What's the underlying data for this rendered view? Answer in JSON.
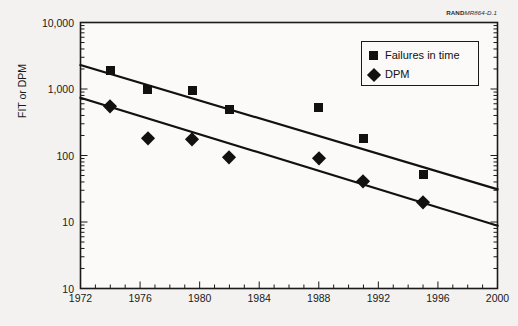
{
  "source_note": {
    "bold": "RAND",
    "italic": "MR864-D.1"
  },
  "chart_data": {
    "type": "scatter",
    "title": "",
    "xlabel": "",
    "ylabel": "FIT or DPM",
    "yscale": "log",
    "xlim": [
      1972,
      2000
    ],
    "ylim": [
      1,
      10000
    ],
    "grid": false,
    "legend_position": "top-right",
    "x_ticks": [
      "1972",
      "1976",
      "1980",
      "1984",
      "1988",
      "1992",
      "1996",
      "2000"
    ],
    "x_tick_values": [
      1972,
      1976,
      1980,
      1984,
      1988,
      1992,
      1996,
      2000
    ],
    "y_ticks": [
      "10,000",
      "1,000",
      "100",
      "10",
      "10"
    ],
    "y_tick_values": [
      10000,
      1000,
      100,
      10,
      1
    ],
    "series": [
      {
        "name": "Failures in time",
        "marker": "square",
        "color": "#111111",
        "x": [
          1974,
          1976.5,
          1979.5,
          1982,
          1988,
          1991,
          1995
        ],
        "values": [
          1900,
          980,
          950,
          490,
          530,
          180,
          52
        ],
        "trendline": {
          "x": [
            1972,
            2000
          ],
          "y": [
            2300,
            31
          ]
        }
      },
      {
        "name": "DPM",
        "marker": "diamond",
        "color": "#111111",
        "x": [
          1974,
          1976.5,
          1979.5,
          1982,
          1988,
          1991,
          1995
        ],
        "values": [
          550,
          185,
          180,
          95,
          92,
          41,
          20
        ],
        "trendline": {
          "x": [
            1972,
            2000
          ],
          "y": [
            740,
            8.8
          ]
        }
      }
    ]
  },
  "legend": {
    "items": [
      {
        "label": "Failures in time",
        "marker": "square"
      },
      {
        "label": "DPM",
        "marker": "diamond"
      }
    ]
  }
}
